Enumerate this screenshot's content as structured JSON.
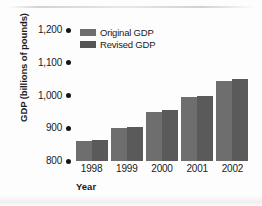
{
  "chart_data": {
    "type": "bar",
    "title": "",
    "xlabel": "Year",
    "ylabel": "GDP (billions of pounds)",
    "categories": [
      "1998",
      "1999",
      "2000",
      "2001",
      "2002"
    ],
    "series": [
      {
        "name": "Original GDP",
        "color": "#6e6e6e",
        "values": [
          860,
          900,
          950,
          995,
          1045
        ]
      },
      {
        "name": "Revised GDP",
        "color": "#555555",
        "values": [
          865,
          905,
          955,
          1000,
          1050
        ]
      }
    ],
    "ylim": [
      800,
      1200
    ],
    "yticks": [
      "800",
      "900",
      "1,000",
      "1,100",
      "1,200"
    ],
    "ytick_values": [
      800,
      900,
      1000,
      1100,
      1200
    ],
    "grid": false,
    "legend_position": "top-left",
    "tick_marker": "dot"
  },
  "axes": {
    "y_title": "GDP (billions of pounds)",
    "x_title": "Year"
  },
  "legend": {
    "items": [
      {
        "label": "Original GDP",
        "swatch": "legend-swatch-original"
      },
      {
        "label": "Revised GDP",
        "swatch": "legend-swatch-revised"
      }
    ]
  }
}
